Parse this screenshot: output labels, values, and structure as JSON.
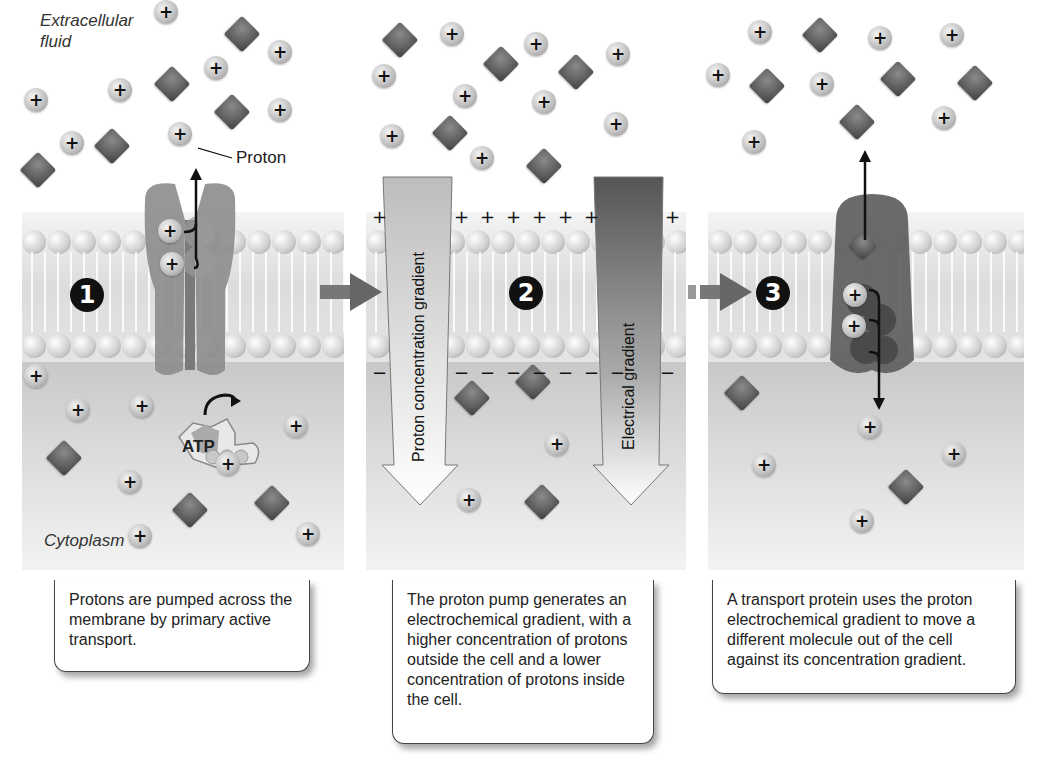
{
  "labels": {
    "extracellular": "Extracellular\nfluid",
    "extracellular_line1": "Extracellular",
    "extracellular_line2": "fluid",
    "proton": "Proton",
    "cytoplasm": "Cytoplasm",
    "atp": "ATP",
    "proton_concentration_gradient": "Proton concentration gradient",
    "electrical_gradient": "Electrical gradient"
  },
  "steps": [
    {
      "number": "1",
      "caption": "Protons are pumped across the membrane by primary active transport."
    },
    {
      "number": "2",
      "caption": "The proton pump generates an electrochemical gradient, with a higher concentration of protons outside the cell and a lower concentration of protons inside the cell."
    },
    {
      "number": "3",
      "caption": "A transport protein uses the proton electrochemical gradient to move a different molecule out of the cell against its concentration gradient."
    }
  ],
  "symbols": {
    "plus": "+",
    "minus": "−"
  },
  "colors": {
    "proton_fill": "#bdbdbd",
    "molecule_fill": "#5a5a5a",
    "pump_protein": "#8c8c8c",
    "transport_protein": "#6e6e6e",
    "step_badge": "#111111",
    "cytoplasm": "#d0d0d0"
  },
  "particles": {
    "panel1": {
      "protons": [
        [
          166,
          12
        ],
        [
          36,
          100
        ],
        [
          120,
          90
        ],
        [
          216,
          68
        ],
        [
          280,
          52
        ],
        [
          280,
          110
        ],
        [
          72,
          143
        ],
        [
          180,
          134
        ],
        [
          36,
          376
        ],
        [
          78,
          410
        ],
        [
          142,
          406
        ],
        [
          296,
          426
        ],
        [
          130,
          482
        ],
        [
          228,
          464
        ],
        [
          140,
          536
        ],
        [
          308,
          534
        ]
      ],
      "diamonds": [
        [
          242,
          34
        ],
        [
          172,
          84
        ],
        [
          232,
          112
        ],
        [
          112,
          146
        ],
        [
          38,
          170
        ],
        [
          64,
          458
        ],
        [
          190,
          510
        ],
        [
          272,
          503
        ]
      ]
    },
    "panel2": {
      "protons": [
        [
          452,
          34
        ],
        [
          384,
          76
        ],
        [
          465,
          96
        ],
        [
          536,
          44
        ],
        [
          618,
          54
        ],
        [
          544,
          102
        ],
        [
          616,
          124
        ],
        [
          392,
          136
        ],
        [
          482,
          158
        ],
        [
          557,
          444
        ],
        [
          469,
          500
        ]
      ],
      "diamonds": [
        [
          400,
          40
        ],
        [
          501,
          64
        ],
        [
          576,
          72
        ],
        [
          450,
          133
        ],
        [
          544,
          166
        ],
        [
          472,
          398
        ],
        [
          533,
          382
        ],
        [
          542,
          502
        ]
      ]
    },
    "panel3": {
      "protons": [
        [
          760,
          32
        ],
        [
          880,
          38
        ],
        [
          952,
          35
        ],
        [
          718,
          75
        ],
        [
          822,
          84
        ],
        [
          944,
          118
        ],
        [
          754,
          142
        ],
        [
          870,
          427
        ],
        [
          764,
          465
        ],
        [
          954,
          454
        ],
        [
          862,
          521
        ]
      ],
      "diamonds": [
        [
          820,
          35
        ],
        [
          767,
          86
        ],
        [
          898,
          79
        ],
        [
          975,
          83
        ],
        [
          857,
          122
        ],
        [
          742,
          393
        ],
        [
          906,
          487
        ]
      ]
    }
  }
}
